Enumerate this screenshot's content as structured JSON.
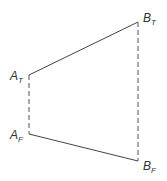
{
  "diagram": {
    "points": {
      "A_T": {
        "label": "A",
        "sub": "T",
        "x": 29,
        "y": 75
      },
      "A_F": {
        "label": "A",
        "sub": "F",
        "x": 29,
        "y": 134
      },
      "B_T": {
        "label": "B",
        "sub": "T",
        "x": 138,
        "y": 22
      },
      "B_F": {
        "label": "B",
        "sub": "F",
        "x": 138,
        "y": 161
      }
    },
    "edges": [
      {
        "from": "A_T",
        "to": "B_T",
        "style": "solid"
      },
      {
        "from": "A_F",
        "to": "B_F",
        "style": "solid"
      },
      {
        "from": "A_T",
        "to": "A_F",
        "style": "dashed"
      },
      {
        "from": "B_T",
        "to": "B_F",
        "style": "dashed"
      }
    ],
    "line_color": "#444444"
  }
}
